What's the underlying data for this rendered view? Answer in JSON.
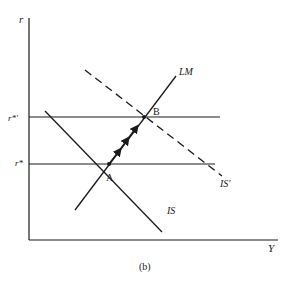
{
  "diagram": {
    "caption": "(b)",
    "axes": {
      "y_label": "r",
      "x_label": "Y"
    },
    "levels": [
      {
        "id": "r_star_prime",
        "label": "r*'"
      },
      {
        "id": "r_star",
        "label": "r*"
      }
    ],
    "curves": [
      {
        "id": "LM",
        "label": "LM",
        "style": "solid"
      },
      {
        "id": "IS",
        "label": "IS",
        "style": "solid"
      },
      {
        "id": "IS_prime",
        "label": "IS'",
        "style": "dashed"
      }
    ],
    "points": [
      {
        "id": "A",
        "label": "A"
      },
      {
        "id": "B",
        "label": "B"
      }
    ],
    "path": {
      "from": "A",
      "to": "B",
      "description": "arrows along LM from A to B"
    },
    "colors": {
      "ink": "#1a1a1a",
      "background": "#ffffff"
    }
  }
}
